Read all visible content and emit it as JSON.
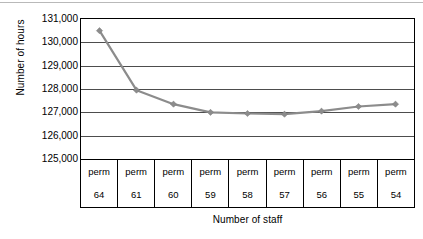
{
  "chart_data": {
    "type": "line",
    "title": "",
    "xlabel": "Number of staff",
    "ylabel": "Number of hours",
    "categories": [
      "64",
      "61",
      "60",
      "59",
      "58",
      "57",
      "56",
      "55",
      "54"
    ],
    "category_type_labels": [
      "perm",
      "perm",
      "perm",
      "perm",
      "perm",
      "perm",
      "perm",
      "perm",
      "perm"
    ],
    "values": [
      130500,
      127950,
      127350,
      127000,
      126950,
      126920,
      127050,
      127250,
      127350
    ],
    "series": [
      {
        "name": "Number of hours",
        "values": [
          130500,
          127950,
          127350,
          127000,
          126950,
          126920,
          127050,
          127250,
          127350
        ]
      }
    ],
    "ylim": [
      125000,
      131000
    ],
    "ytick_values": [
      131000,
      130000,
      129000,
      128000,
      127000,
      126000,
      125000
    ],
    "ytick_labels": [
      "131,000",
      "130,000",
      "129,000",
      "128,000",
      "127,000",
      "126,000",
      "125,000"
    ],
    "grid": "horizontal",
    "legend": "none",
    "marker": "diamond",
    "line_color": "#8c8c8c",
    "marker_color": "#8c8c8c",
    "gridline_color": "#4d4d4d",
    "axis_color": "#000000",
    "background_color": "#ffffff"
  }
}
